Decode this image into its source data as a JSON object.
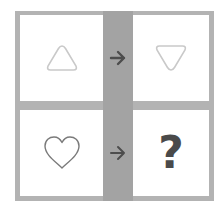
{
  "puzzle": {
    "rows": [
      {
        "left": {
          "shape": "triangle-up-icon",
          "stroke": "#c9c9c9"
        },
        "connector": {
          "icon": "arrow-right-icon",
          "color": "#4d4d4d"
        },
        "right": {
          "shape": "triangle-down-icon",
          "stroke": "#c9c9c9"
        }
      },
      {
        "left": {
          "shape": "heart-icon",
          "stroke": "#7a7a7a"
        },
        "connector": {
          "icon": "arrow-right-icon",
          "color": "#4d4d4d"
        },
        "right": {
          "text": "?"
        }
      }
    ],
    "colors": {
      "frame": "#b3b3b3",
      "middle_column": "#a3a3a3",
      "cell_background": "#ffffff",
      "question_mark": "#4a4a4a"
    }
  }
}
